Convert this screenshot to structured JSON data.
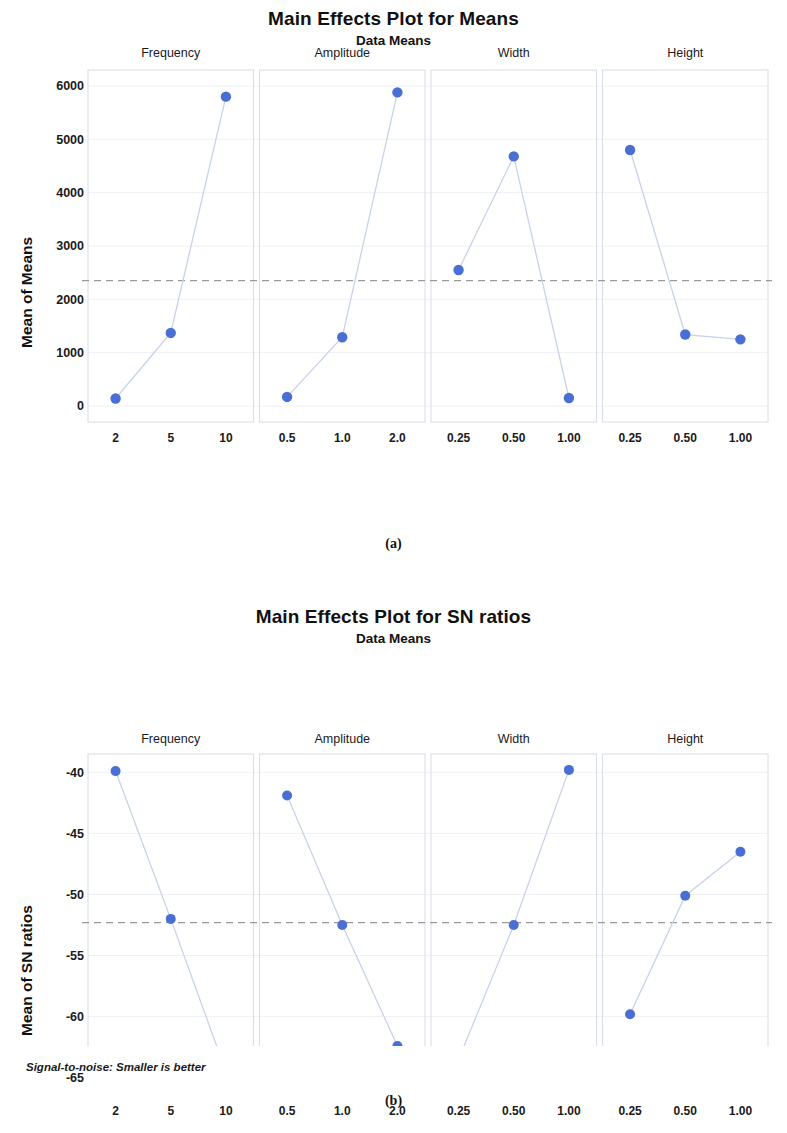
{
  "figure_a": {
    "title": "Main Effects Plot for Means",
    "subtitle": "Data Means",
    "ylabel": "Mean of Means",
    "caption": "(a)",
    "yticks": [
      "0",
      "1000",
      "2000",
      "3000",
      "4000",
      "5000",
      "6000"
    ],
    "panels": [
      "Frequency",
      "Amplitude",
      "Width",
      "Height"
    ],
    "xticks": [
      "2",
      "5",
      "10",
      "0.5",
      "1.0",
      "2.0",
      "0.25",
      "0.50",
      "1.00",
      "0.25",
      "0.50",
      "1.00"
    ]
  },
  "figure_b": {
    "title": "Main Effects Plot for SN ratios",
    "subtitle": "Data Means",
    "ylabel": "Mean of SN ratios",
    "caption": "(b)",
    "footnote": "Signal-to-noise: Smaller is better",
    "yticks": [
      "-65",
      "-60",
      "-55",
      "-50",
      "-45",
      "-40"
    ],
    "panels": [
      "Frequency",
      "Amplitude",
      "Width",
      "Height"
    ],
    "xticks": [
      "2",
      "5",
      "10",
      "0.5",
      "1.0",
      "2.0",
      "0.25",
      "0.50",
      "1.00",
      "0.25",
      "0.50",
      "1.00"
    ]
  },
  "style": {
    "marker_color": "#4a6fd4",
    "line_color": "#c9d2ec",
    "reference_line_color": "#9a9a9a",
    "grid_color": "#eef0f6",
    "axis_color": "#d8dce8"
  },
  "chart_data": [
    {
      "type": "line",
      "title": "Main Effects Plot for Means",
      "subtitle": "Data Means",
      "xlabel": "",
      "ylabel": "Mean of Means",
      "ylim": [
        -300,
        6300
      ],
      "yticks": [
        0,
        1000,
        2000,
        3000,
        4000,
        5000,
        6000
      ],
      "grid": true,
      "legend": "none",
      "reference_line": 2350,
      "panels": [
        {
          "name": "Frequency",
          "categories": [
            "2",
            "5",
            "10"
          ],
          "values": [
            140,
            1370,
            5800
          ]
        },
        {
          "name": "Amplitude",
          "categories": [
            "0.5",
            "1.0",
            "2.0"
          ],
          "values": [
            170,
            1290,
            5880
          ]
        },
        {
          "name": "Width",
          "categories": [
            "0.25",
            "0.50",
            "1.00"
          ],
          "values": [
            2550,
            4680,
            150
          ]
        },
        {
          "name": "Height",
          "categories": [
            "0.25",
            "0.50",
            "1.00"
          ],
          "values": [
            4800,
            1340,
            1250
          ]
        }
      ]
    },
    {
      "type": "line",
      "title": "Main Effects Plot for SN ratios",
      "subtitle": "Data Means",
      "xlabel": "",
      "ylabel": "Mean of SN ratios",
      "ylim": [
        -66.5,
        -38.5
      ],
      "yticks": [
        -65,
        -60,
        -55,
        -50,
        -45,
        -40
      ],
      "grid": true,
      "legend": "none",
      "reference_line": -52.3,
      "annotation": "Signal-to-noise: Smaller is better",
      "panels": [
        {
          "name": "Frequency",
          "categories": [
            "2",
            "5",
            "10"
          ],
          "values": [
            -39.9,
            -52.0,
            -64.5
          ]
        },
        {
          "name": "Amplitude",
          "categories": [
            "0.5",
            "1.0",
            "2.0"
          ],
          "values": [
            -41.9,
            -52.5,
            -62.4
          ]
        },
        {
          "name": "Width",
          "categories": [
            "0.25",
            "0.50",
            "1.00"
          ],
          "values": [
            -63.5,
            -52.5,
            -39.8
          ]
        },
        {
          "name": "Height",
          "categories": [
            "0.25",
            "0.50",
            "1.00"
          ],
          "values": [
            -59.8,
            -50.1,
            -46.5
          ]
        }
      ]
    }
  ]
}
